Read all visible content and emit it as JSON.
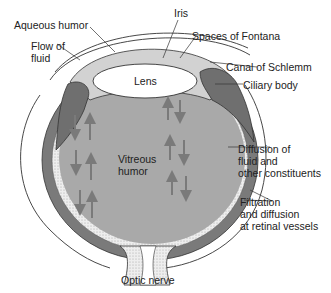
{
  "diagram": {
    "colors": {
      "background": "#ffffff",
      "outline": "#333333",
      "choroid": "#7a7a7a",
      "vitreous": "#a9a9a9",
      "aqueous": "#d2d2d2",
      "lens": "#ffffff",
      "retina_stipple": "#e6e6e6",
      "arrow": "#7a7a7a",
      "text": "#222222"
    },
    "labels": {
      "aqueous_humor": "Aqueous humor",
      "iris": "Iris",
      "flow_of_fluid": "Flow of\nfluid",
      "spaces_of_fontana": "Spaces of Fontana",
      "canal_of_schlemm": "Canal of Schlemm",
      "ciliary_body": "Ciliary body",
      "lens": "Lens",
      "vitreous_humor": "Vitreous\nhumor",
      "diffusion": "Diffusion of\nfluid and\nother constituents",
      "filtration": "Filtration\nand diffusion\nat retinal vessels",
      "optic_nerve": "Optic nerve"
    }
  }
}
